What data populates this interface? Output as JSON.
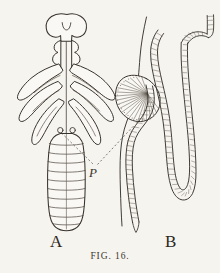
{
  "plate": {
    "caption": "FIG. 16.",
    "background_color": "#f6f4ef",
    "ink_color": "#37322c",
    "width": 220,
    "height": 273
  },
  "figures": [
    {
      "key": "A",
      "label": "A",
      "description": "Dorsal view of insect larva with bilobed head, three pairs of thoracic legs and segmented abdomen",
      "label_x": 50,
      "label_y": 233
    },
    {
      "key": "B",
      "label": "B",
      "description": "Enlarged detail of fan-shaped gill and stippled looping tracheal tubes",
      "label_x": 165,
      "label_y": 233
    }
  ],
  "annotations": [
    {
      "key": "P",
      "label": "P",
      "style": "italic",
      "label_x": 89,
      "label_y": 166,
      "leader_lines": 2,
      "leader_style": "dashed",
      "points_to": [
        "larva-spiracle",
        "gill-fan"
      ]
    }
  ],
  "icons": {
    "larva": "larva-dorsal-icon",
    "gill": "gill-fan-icon",
    "trachea": "tracheal-tube-icon"
  }
}
